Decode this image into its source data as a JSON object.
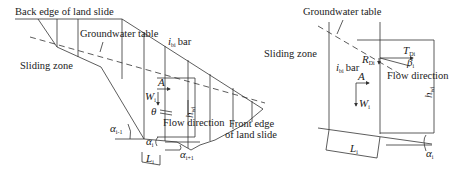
{
  "left_figure": {
    "labels": {
      "back_edge": "Back edge of land slide",
      "groundwater_table": "Groundwater table",
      "sliding_zone": "Sliding zone",
      "i_symbol": "i",
      "i_sub": "bi",
      "bar_text": "bar",
      "front_edge_line1": "Front edge",
      "front_edge_line2": "of land slide",
      "flow_direction": "Flow direction",
      "A": "A",
      "W": "W",
      "W_sub": "i",
      "theta": "θ",
      "h": "h",
      "h_sub": "wi",
      "alpha_prev": "α",
      "alpha_prev_sub": "i-1",
      "alpha": "α",
      "alpha_sub": "i",
      "alpha_next": "α",
      "alpha_next_sub": "i+1",
      "L": "L",
      "L_sub": "i"
    }
  },
  "right_figure": {
    "labels": {
      "groundwater_table": "Groundwater table",
      "sliding_zone": "Sliding zone",
      "i_symbol": "i",
      "i_sub": "bi",
      "bar_text": "bar",
      "T": "T",
      "T_sub": "Di",
      "R": "R",
      "R_sub": "Di",
      "beta": "β",
      "beta_sub": "i",
      "flow_direction": "Flow direction",
      "A": "A",
      "W": "W",
      "W_sub": "i",
      "h": "h",
      "h_sub": "wi",
      "L": "L",
      "L_sub": "i",
      "alpha": "α",
      "alpha_sub": "i"
    }
  }
}
